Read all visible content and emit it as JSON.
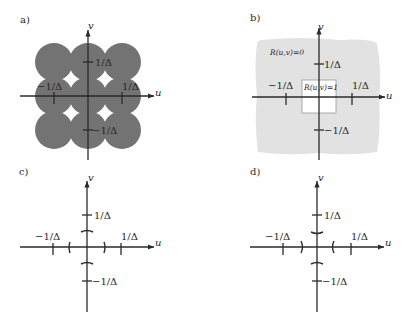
{
  "figure": {
    "panels": [
      {
        "id": "a",
        "label": "a)",
        "axis_u": "u",
        "axis_v": "v",
        "tick_pos": "1/Δ",
        "tick_neg": "−1/Δ",
        "description": "3x3 grid of overlapping gray discs centered at multiples of 1/Δ"
      },
      {
        "id": "b",
        "label": "b)",
        "axis_u": "u",
        "axis_v": "v",
        "tick_pos": "1/Δ",
        "tick_neg": "−1/Δ",
        "region_outside": "R(u,v)=0",
        "region_inside": "R(u,v)=1"
      },
      {
        "id": "c",
        "label": "c)",
        "axis_u": "u",
        "axis_v": "v",
        "tick_pos": "1/Δ",
        "tick_neg": "−1/Δ"
      },
      {
        "id": "d",
        "label": "d)",
        "axis_u": "u",
        "axis_v": "v",
        "tick_pos": "1/Δ",
        "tick_neg": "−1/Δ"
      }
    ],
    "colors": {
      "disc_fill": "#737373",
      "region_gray": "#e2e2e2",
      "ink": "#2a2a2a",
      "background": "#ffffff"
    }
  }
}
